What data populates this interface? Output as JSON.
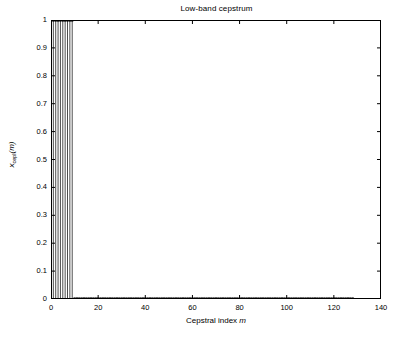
{
  "figure": {
    "title": "Low-band cepstrum",
    "background_color": "#ffffff",
    "axis_color": "#000000"
  },
  "axes": {
    "xlabel_prefix": "Cepstral index ",
    "xlabel_var": "m",
    "ylabel_base": "x",
    "ylabel_sub": "cepl",
    "ylabel_arg": "(m)",
    "xticks": [
      "0",
      "20",
      "40",
      "60",
      "80",
      "100",
      "120",
      "140"
    ],
    "yticks": [
      "0",
      "0.1",
      "0.2",
      "0.3",
      "0.4",
      "0.5",
      "0.6",
      "0.7",
      "0.8",
      "0.9",
      "1"
    ]
  },
  "chart_data": {
    "type": "line",
    "plot_style": "stem",
    "title": "Low-band cepstrum",
    "xlabel": "Cepstral index m",
    "ylabel": "x_cepl(m)",
    "xlim": [
      0,
      140
    ],
    "ylim": [
      0,
      1
    ],
    "xticks": [
      0,
      20,
      40,
      60,
      80,
      100,
      120,
      140
    ],
    "yticks": [
      0,
      0.1,
      0.2,
      0.3,
      0.4,
      0.5,
      0.6,
      0.7,
      0.8,
      0.9,
      1
    ],
    "grid": false,
    "legend": null,
    "marker": "circle",
    "marker_color": "#000000",
    "line_color": "#000000",
    "series": [
      {
        "name": "x_cepl(m)",
        "x": [
          0,
          1,
          2,
          3,
          4,
          5,
          6,
          7,
          8,
          9,
          10,
          11,
          12,
          13,
          14,
          15,
          16,
          17,
          18,
          19,
          20,
          21,
          22,
          23,
          24,
          25,
          26,
          27,
          28,
          29,
          30,
          31,
          32,
          33,
          34,
          35,
          36,
          37,
          38,
          39,
          40,
          41,
          42,
          43,
          44,
          45,
          46,
          47,
          48,
          49,
          50,
          51,
          52,
          53,
          54,
          55,
          56,
          57,
          58,
          59,
          60,
          61,
          62,
          63,
          64,
          65,
          66,
          67,
          68,
          69,
          70,
          71,
          72,
          73,
          74,
          75,
          76,
          77,
          78,
          79,
          80,
          81,
          82,
          83,
          84,
          85,
          86,
          87,
          88,
          89,
          90,
          91,
          92,
          93,
          94,
          95,
          96,
          97,
          98,
          99,
          100,
          101,
          102,
          103,
          104,
          105,
          106,
          107,
          108,
          109,
          110,
          111,
          112,
          113,
          114,
          115,
          116,
          117,
          118,
          119,
          120,
          121,
          122,
          123,
          124,
          125,
          126,
          127,
          128
        ],
        "values": [
          1,
          1,
          1,
          1,
          1,
          1,
          1,
          1,
          1,
          1,
          0,
          0,
          0,
          0,
          0,
          0,
          0,
          0,
          0,
          0,
          0,
          0,
          0,
          0,
          0,
          0,
          0,
          0,
          0,
          0,
          0,
          0,
          0,
          0,
          0,
          0,
          0,
          0,
          0,
          0,
          0,
          0,
          0,
          0,
          0,
          0,
          0,
          0,
          0,
          0,
          0,
          0,
          0,
          0,
          0,
          0,
          0,
          0,
          0,
          0,
          0,
          0,
          0,
          0,
          0,
          0,
          0,
          0,
          0,
          0,
          0,
          0,
          0,
          0,
          0,
          0,
          0,
          0,
          0,
          0,
          0,
          0,
          0,
          0,
          0,
          0,
          0,
          0,
          0,
          0,
          0,
          0,
          0,
          0,
          0,
          0,
          0,
          0,
          0,
          0,
          0,
          0,
          0,
          0,
          0,
          0,
          0,
          0,
          0,
          0,
          0,
          0,
          0,
          0,
          0,
          0,
          0,
          0,
          0,
          0,
          0,
          0,
          0,
          0,
          0,
          0,
          0,
          0,
          0
        ]
      }
    ]
  }
}
